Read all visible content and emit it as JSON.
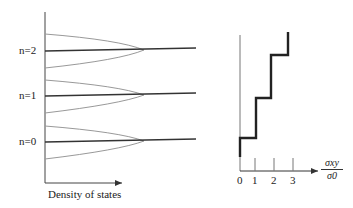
{
  "left_panel": {
    "levels": [
      {
        "label": "n=2",
        "y": 50
      },
      {
        "label": "n=1",
        "y": 95
      },
      {
        "label": "n=0",
        "y": 141
      }
    ],
    "xlabel": "Density of states",
    "line_color": "#333333",
    "curve_color": "#999999"
  },
  "right_panel": {
    "ticks": [
      "0",
      "1",
      "2",
      "3"
    ],
    "xlabel_num": "σxy",
    "xlabel_den": "σ0",
    "step_color": "#222222"
  }
}
